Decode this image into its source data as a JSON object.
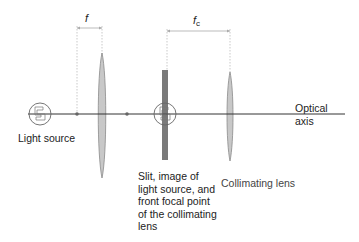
{
  "diagram": {
    "labels": {
      "light_source": "Light source",
      "slit": "Slit, image of light source, and front focal point of the collimating lens",
      "slit_lines": [
        "Slit, image of",
        "light source, and",
        "front focal point",
        "of the collimating",
        "lens"
      ],
      "collimating_lens": "Collimating lens",
      "optical_axis_line1": "Optical",
      "optical_axis_line2": "axis",
      "focal_length_first": "f",
      "focal_length_collimator_base": "f",
      "focal_length_collimator_sub": "c"
    },
    "colors": {
      "axis": "#333333",
      "lens_fill": "#c8c8c8",
      "lens_stroke": "#8a8a8a",
      "slit_fill": "#7a7a7a",
      "dimension_line": "#aaaaaa",
      "text": "#222222"
    },
    "elements": [
      {
        "name": "light-source",
        "x": 40,
        "y": 114
      },
      {
        "name": "front-focal-point-dot",
        "x": 77,
        "y": 114
      },
      {
        "name": "condenser-lens",
        "x": 102,
        "y": 114
      },
      {
        "name": "back-focal-point-dot",
        "x": 127,
        "y": 114
      },
      {
        "name": "slit",
        "x": 165,
        "y": 114
      },
      {
        "name": "collimating-lens",
        "x": 230,
        "y": 114
      }
    ]
  }
}
